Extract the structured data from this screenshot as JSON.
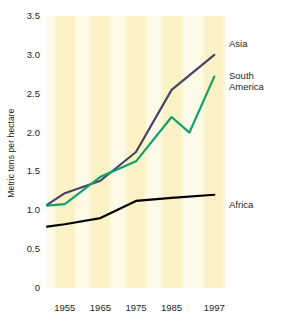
{
  "chart_data": {
    "type": "line",
    "title": "",
    "xlabel": "",
    "ylabel": "Metric tons per hectare",
    "x": [
      1955,
      1965,
      1975,
      1985,
      1997
    ],
    "xtick_labels": [
      "1955",
      "1965",
      "1975",
      "1985",
      "1997"
    ],
    "ytick_labels": [
      "0",
      "0.5",
      "1.0",
      "1.5",
      "2.0",
      "2.5",
      "3.0",
      "3.5"
    ],
    "ytick_values": [
      0,
      0.5,
      1.0,
      1.5,
      2.0,
      2.5,
      3.0,
      3.5
    ],
    "ylim": [
      0,
      3.5
    ],
    "xlim": [
      1950,
      2000
    ],
    "grid": false,
    "legend_position": "right-inline",
    "series": [
      {
        "name": "Asia",
        "color": "#4a4266",
        "x": [
          1950,
          1955,
          1965,
          1975,
          1985,
          1997
        ],
        "values": [
          1.07,
          1.22,
          1.38,
          1.75,
          2.55,
          3.0
        ]
      },
      {
        "name": "South America",
        "color": "#13a06d",
        "x": [
          1950,
          1955,
          1965,
          1975,
          1985,
          1990,
          1997
        ],
        "values": [
          1.06,
          1.08,
          1.43,
          1.63,
          2.2,
          2.0,
          2.72
        ]
      },
      {
        "name": "Africa",
        "color": "#000000",
        "x": [
          1950,
          1955,
          1965,
          1975,
          1985,
          1997
        ],
        "values": [
          0.79,
          0.82,
          0.9,
          1.12,
          1.16,
          1.2
        ]
      }
    ]
  },
  "labels": {
    "asia": "Asia",
    "south_america": "South\nAmerica",
    "africa": "Africa"
  },
  "colors": {
    "band": "#faf2c4",
    "band_light": "#fdfbe8",
    "asia": "#4a4266",
    "south_america": "#13a06d",
    "africa": "#000000",
    "text": "#231f20",
    "background": "#ffffff"
  }
}
